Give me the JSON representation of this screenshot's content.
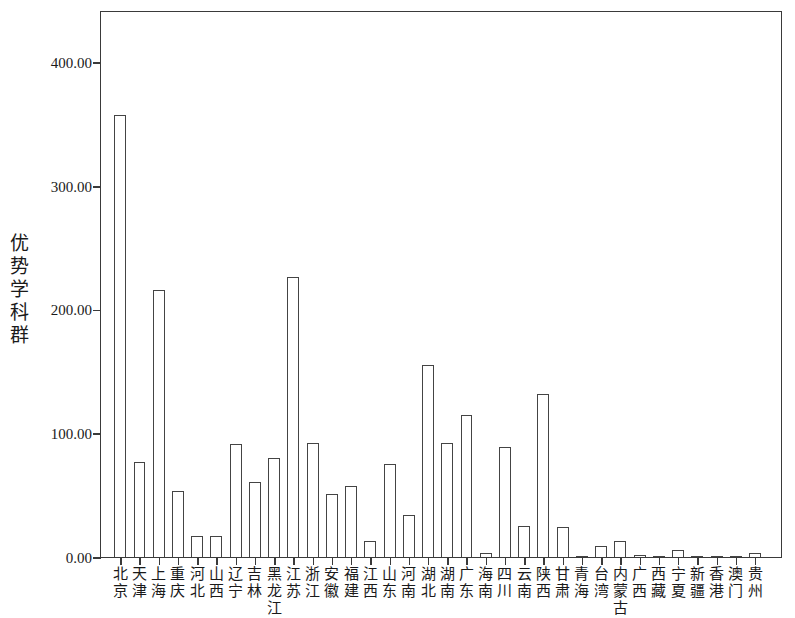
{
  "chart_data": {
    "type": "bar",
    "title": "",
    "subtitle": "",
    "xlabel": "",
    "ylabel": "优势学科群",
    "ylim": [
      0,
      442
    ],
    "grid": false,
    "legend": null,
    "y_ticks": [
      {
        "value": 400,
        "label": "400.00"
      },
      {
        "value": 300,
        "label": "300.00"
      },
      {
        "value": 200,
        "label": "200.00"
      },
      {
        "value": 100,
        "label": "100.00"
      },
      {
        "value": 0,
        "label": "0.00"
      }
    ],
    "categories": [
      "北京",
      "天津",
      "上海",
      "重庆",
      "河北",
      "山西",
      "辽宁",
      "吉林",
      "黑龙江",
      "江苏",
      "浙江",
      "安徽",
      "福建",
      "江西",
      "山东",
      "河南",
      "湖北",
      "湖南",
      "广东",
      "海南",
      "四川",
      "云南",
      "陕西",
      "甘肃",
      "青海",
      "台湾",
      "内蒙古",
      "广西",
      "西藏",
      "宁夏",
      "新疆",
      "香港",
      "澳门",
      "贵州"
    ],
    "values": [
      357,
      77,
      216,
      53,
      17,
      17,
      91,
      61,
      80,
      226,
      92,
      51,
      57,
      13,
      75,
      34,
      155,
      92,
      115,
      3,
      89,
      25,
      132,
      24,
      1,
      9,
      13,
      2,
      1,
      6,
      1,
      1,
      1,
      3
    ],
    "bar_style": {
      "fill": "#ffffff",
      "edge": "#444444",
      "edge_width_px": 1.4
    },
    "axis_color": "#3a3a3a",
    "background": "#ffffff"
  }
}
